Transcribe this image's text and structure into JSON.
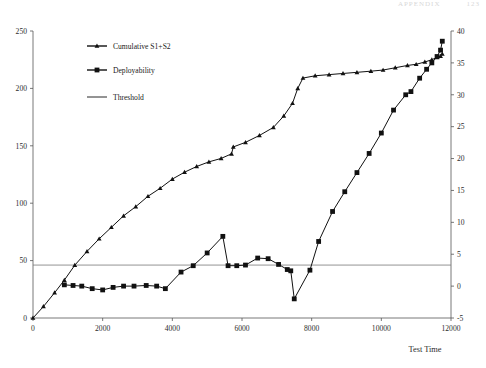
{
  "page_header": {
    "text": "APPENDIX",
    "page_number": "123"
  },
  "chart_data": {
    "type": "line",
    "title": "",
    "xlabel": "Test Time",
    "ylabel": "",
    "grid": false,
    "legend_position": "top-left-inside",
    "xlim": [
      0,
      12000
    ],
    "xticks": [
      0,
      2000,
      4000,
      6000,
      8000,
      10000,
      12000
    ],
    "left_axis": {
      "ylim": [
        0,
        250
      ],
      "yticks": [
        0,
        50,
        100,
        150,
        200,
        250
      ],
      "series_ref": "Cumulative S1+S2"
    },
    "right_axis": {
      "ylim": [
        -5,
        40
      ],
      "yticks": [
        -5,
        0,
        5,
        10,
        15,
        20,
        25,
        30,
        35,
        40
      ],
      "series_ref": "Deployability"
    },
    "annotations": [
      {
        "label": "Threshold",
        "axis": "right",
        "value": 3.3
      }
    ],
    "series": [
      {
        "name": "Cumulative S1+S2",
        "axis": "left",
        "marker": "triangle",
        "color": "#111111",
        "points": [
          [
            0,
            0
          ],
          [
            300,
            10
          ],
          [
            620,
            22
          ],
          [
            900,
            33
          ],
          [
            1200,
            46
          ],
          [
            1550,
            58
          ],
          [
            1900,
            69
          ],
          [
            2250,
            79
          ],
          [
            2600,
            89
          ],
          [
            2950,
            97
          ],
          [
            3300,
            106
          ],
          [
            3650,
            113
          ],
          [
            4000,
            121
          ],
          [
            4350,
            127
          ],
          [
            4700,
            132
          ],
          [
            5050,
            136
          ],
          [
            5400,
            139
          ],
          [
            5700,
            143
          ],
          [
            5750,
            149
          ],
          [
            6100,
            153
          ],
          [
            6500,
            159
          ],
          [
            6900,
            166
          ],
          [
            7200,
            176
          ],
          [
            7450,
            187
          ],
          [
            7600,
            200
          ],
          [
            7750,
            209
          ],
          [
            8100,
            211
          ],
          [
            8500,
            212
          ],
          [
            8900,
            213
          ],
          [
            9300,
            214
          ],
          [
            9700,
            215
          ],
          [
            10050,
            216
          ],
          [
            10400,
            218
          ],
          [
            10750,
            220
          ],
          [
            11000,
            221
          ],
          [
            11250,
            223
          ],
          [
            11450,
            225
          ],
          [
            11600,
            227
          ],
          [
            11700,
            228
          ],
          [
            11750,
            230
          ]
        ]
      },
      {
        "name": "Deployability",
        "axis": "right",
        "marker": "square",
        "color": "#111111",
        "points": [
          [
            900,
            0.2
          ],
          [
            1150,
            0.1
          ],
          [
            1400,
            0.0
          ],
          [
            1700,
            -0.4
          ],
          [
            2000,
            -0.6
          ],
          [
            2300,
            -0.2
          ],
          [
            2600,
            0.0
          ],
          [
            2900,
            0.0
          ],
          [
            3250,
            0.1
          ],
          [
            3550,
            0.0
          ],
          [
            3800,
            -0.4
          ],
          [
            4250,
            2.2
          ],
          [
            4600,
            3.2
          ],
          [
            5000,
            5.2
          ],
          [
            5450,
            7.8
          ],
          [
            5600,
            3.2
          ],
          [
            5850,
            3.2
          ],
          [
            6100,
            3.3
          ],
          [
            6450,
            4.4
          ],
          [
            6750,
            4.3
          ],
          [
            7050,
            3.4
          ],
          [
            7300,
            2.6
          ],
          [
            7400,
            2.4
          ],
          [
            7500,
            -2.0
          ],
          [
            7950,
            2.5
          ],
          [
            8200,
            7.0
          ],
          [
            8600,
            11.7
          ],
          [
            8950,
            14.8
          ],
          [
            9300,
            17.8
          ],
          [
            9650,
            20.8
          ],
          [
            10000,
            24.0
          ],
          [
            10350,
            27.6
          ],
          [
            10700,
            30.0
          ],
          [
            10850,
            30.5
          ],
          [
            11100,
            32.6
          ],
          [
            11300,
            34.0
          ],
          [
            11450,
            35.0
          ],
          [
            11600,
            36.0
          ],
          [
            11700,
            37.0
          ],
          [
            11750,
            38.4
          ]
        ]
      }
    ],
    "legend": [
      {
        "label": "Cumulative S1+S2",
        "marker": "triangle"
      },
      {
        "label": "Deployability",
        "marker": "square"
      },
      {
        "label": "Threshold",
        "marker": "line"
      }
    ]
  }
}
